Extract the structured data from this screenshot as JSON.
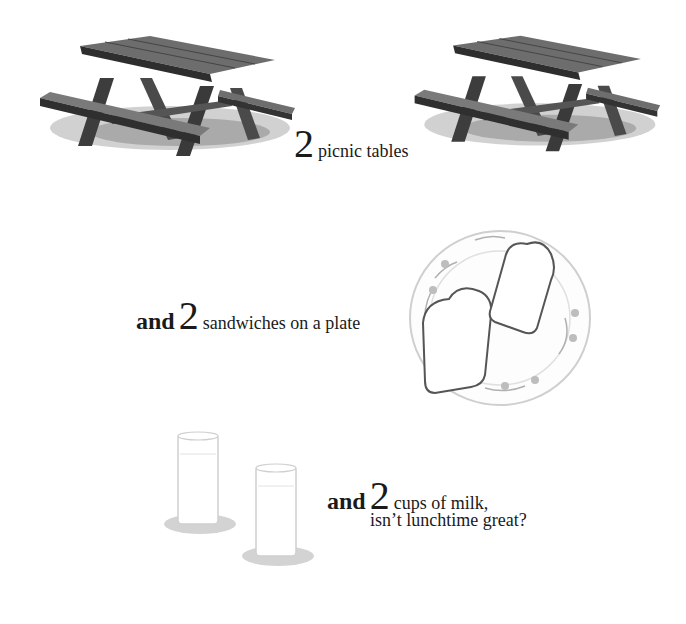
{
  "page": {
    "sections": [
      {
        "id": "tables",
        "lead": "",
        "number": "2",
        "text": "picnic tables",
        "illustration": "picnic-table-icon",
        "count": 2
      },
      {
        "id": "sandwiches",
        "lead": "and",
        "number": "2",
        "text": "sandwiches on a plate",
        "illustration": "sandwich-plate-icon",
        "count": 2
      },
      {
        "id": "milk",
        "lead": "and",
        "number": "2",
        "text": "cups of milk,",
        "text_line2": "isn’t lunchtime great?",
        "illustration": "milk-glass-icon",
        "count": 2
      }
    ]
  },
  "colors": {
    "background": "#ffffff",
    "text": "#1a1a1a",
    "wood_dark": "#3a3a3a",
    "wood_light": "#8a8a8a",
    "grass": "#9a9a9a",
    "pencil": "#b5b5b5"
  }
}
